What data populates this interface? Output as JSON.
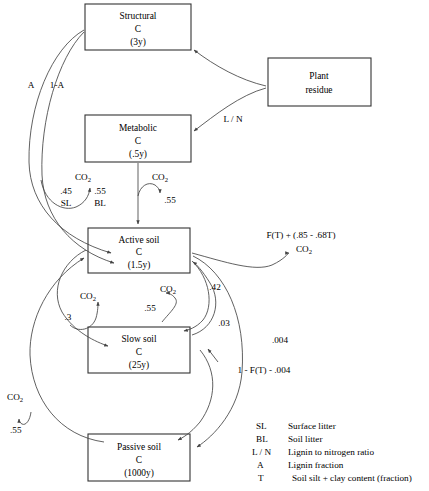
{
  "diagram": {
    "boxes": [
      {
        "id": "structural",
        "name": "Structural",
        "symbol": "C",
        "turnover": "(3y)"
      },
      {
        "id": "plant_residue",
        "name": "Plant",
        "symbol": "residue",
        "turnover": ""
      },
      {
        "id": "metabolic",
        "name": "Metabolic",
        "symbol": "C",
        "turnover": "(.5y)"
      },
      {
        "id": "active_soil",
        "name": "Active soil",
        "symbol": "C",
        "turnover": "(1.5y)"
      },
      {
        "id": "slow_soil",
        "name": "Slow soil",
        "symbol": "C",
        "turnover": "(25y)"
      },
      {
        "id": "passive_soil",
        "name": "Passive soil",
        "symbol": "C",
        "turnover": "(1000y)"
      }
    ],
    "labels": {
      "a_fraction": "A",
      "one_minus_a": "1-A",
      "l_over_n": "L / N",
      "co2_1": "CO",
      "co2_sub": "2",
      "frac_45": ".45",
      "frac_55_bl": ".55",
      "sl": "SL",
      "bl": "BL",
      "metabolic_co2_frac": ".55",
      "ft_expression": "F(T) + (.85 - .68T)",
      "frac_42": ".42",
      "frac_03": ".03",
      "frac_004": ".004",
      "one_minus_ft": "1 - F(T) - .004",
      "frac_3": ".3",
      "slow_co2_frac": ".55",
      "passive_co2_frac": ".55"
    },
    "legend": [
      {
        "key": "SL",
        "desc": "Surface litter"
      },
      {
        "key": "BL",
        "desc": "Soil litter"
      },
      {
        "key": "L / N",
        "desc": "Lignin to nitrogen ratio"
      },
      {
        "key": "A",
        "desc": "Lignin fraction"
      },
      {
        "key": "T",
        "desc": "Soil silt + clay content (fraction)"
      }
    ],
    "colors": {
      "background": "#ffffff",
      "box_stroke": "#333333",
      "line_stroke": "#444444",
      "text": "#000000"
    }
  }
}
